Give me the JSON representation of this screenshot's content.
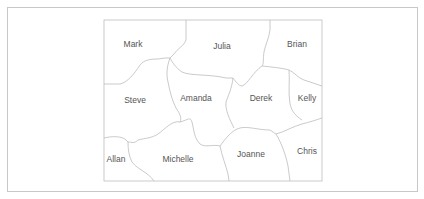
{
  "diagram": {
    "type": "region-map",
    "regions": [
      {
        "name": "Mark",
        "x": 133,
        "y": 47
      },
      {
        "name": "Julia",
        "x": 222,
        "y": 49
      },
      {
        "name": "Brian",
        "x": 297,
        "y": 47
      },
      {
        "name": "Steve",
        "x": 135,
        "y": 103
      },
      {
        "name": "Amanda",
        "x": 196,
        "y": 101
      },
      {
        "name": "Derek",
        "x": 261,
        "y": 101
      },
      {
        "name": "Kelly",
        "x": 307,
        "y": 101
      },
      {
        "name": "Allan",
        "x": 116,
        "y": 162
      },
      {
        "name": "Michelle",
        "x": 178,
        "y": 162
      },
      {
        "name": "Joanne",
        "x": 251,
        "y": 157
      },
      {
        "name": "Chris",
        "x": 307,
        "y": 154
      }
    ],
    "colors": {
      "border": "#bdbdbd",
      "label": "#555555",
      "background": "#ffffff"
    }
  }
}
